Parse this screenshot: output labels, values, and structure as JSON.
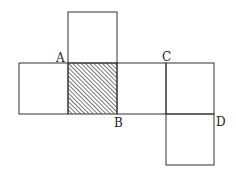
{
  "diagram": {
    "type": "cube-net",
    "colors": {
      "line": "#333333",
      "hatch": "#555555",
      "background": "#ffffff"
    },
    "squares": [
      {
        "id": "top",
        "x": 68,
        "y": 12,
        "size": 49,
        "shaded": false
      },
      {
        "id": "left",
        "x": 19,
        "y": 63,
        "size": 49,
        "shaded": false
      },
      {
        "id": "shaded-center",
        "x": 68,
        "y": 63,
        "size": 49,
        "shaded": true
      },
      {
        "id": "middle-right",
        "x": 117,
        "y": 63,
        "size": 49,
        "shaded": false
      },
      {
        "id": "right",
        "x": 166,
        "y": 63,
        "size": 48,
        "shaded": false
      },
      {
        "id": "bottom",
        "x": 166,
        "y": 114,
        "size": 48,
        "shaded": false
      }
    ],
    "labels": [
      {
        "text": "A",
        "x": 56,
        "y": 53
      },
      {
        "text": "B",
        "x": 114,
        "y": 117
      },
      {
        "text": "C",
        "x": 162,
        "y": 52
      },
      {
        "text": "D",
        "x": 216,
        "y": 116
      }
    ]
  }
}
